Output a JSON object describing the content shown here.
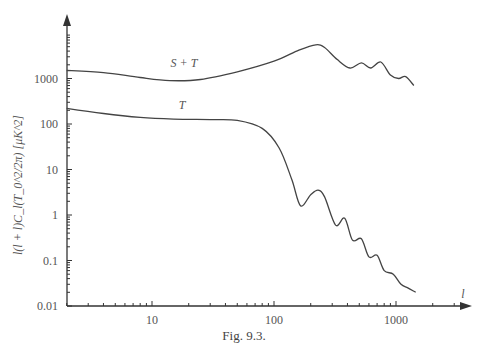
{
  "chart_data": {
    "type": "line",
    "title": "",
    "caption": "Fig. 9.3.",
    "xlabel": "l",
    "ylabel": "l(l + l)C_l (T_0^2/2π) [μK^2]",
    "xscale": "log",
    "yscale": "log",
    "xlim": [
      2,
      2800
    ],
    "ylim": [
      0.01,
      20000
    ],
    "grid": false,
    "legend": "inline labels",
    "x_ticks": [
      "10",
      "100",
      "1000"
    ],
    "y_ticks": [
      "0.01",
      "0.1",
      "1",
      "10",
      "100",
      "1000"
    ],
    "series": [
      {
        "name": "S + T",
        "x": [
          2,
          4,
          8,
          14,
          25,
          50,
          100,
          160,
          220,
          260,
          330,
          420,
          520,
          620,
          750,
          900,
          1050,
          1200,
          1400
        ],
        "y": [
          1500,
          1350,
          1050,
          900,
          950,
          1400,
          2400,
          4200,
          5500,
          4800,
          2600,
          1700,
          2200,
          1700,
          2300,
          1200,
          1000,
          1100,
          700
        ]
      },
      {
        "name": "T",
        "x": [
          2,
          4,
          8,
          15,
          30,
          50,
          80,
          110,
          140,
          165,
          200,
          230,
          260,
          320,
          380,
          440,
          520,
          600,
          700,
          800,
          950,
          1100,
          1250,
          1450
        ],
        "y": [
          220,
          170,
          140,
          128,
          125,
          120,
          80,
          30,
          6,
          1.6,
          2.8,
          3.5,
          2.5,
          0.6,
          0.85,
          0.28,
          0.3,
          0.12,
          0.13,
          0.06,
          0.05,
          0.03,
          0.025,
          0.02
        ]
      }
    ]
  },
  "axis": {
    "y_labels": [
      "1000",
      "100",
      "10",
      "1",
      "0.1",
      "0.01"
    ],
    "x_labels": [
      "10",
      "100",
      "1000"
    ],
    "x_title": "l",
    "y_title": "l(l + l)C_l(T_0^2/2π) [μK^2]"
  },
  "labels": {
    "st": "S + T",
    "t": "T"
  },
  "caption": "Fig. 9.3."
}
